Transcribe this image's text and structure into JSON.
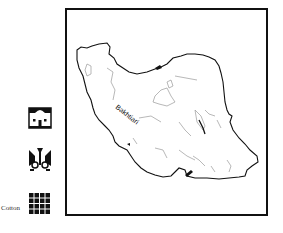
{
  "map": {
    "region": "Iran",
    "labels": [
      {
        "text": "Bakhtiari",
        "rotation": 38
      }
    ]
  },
  "legend": {
    "items": [
      {
        "icon": "house-icon",
        "label": ""
      },
      {
        "icon": "tribal-motif-icon",
        "label": ""
      },
      {
        "icon": "grid-weave-icon",
        "label": "Cotton"
      }
    ]
  },
  "colors": {
    "outline": "#111111",
    "rivers": "#9a9a9a",
    "background": "#ffffff"
  }
}
